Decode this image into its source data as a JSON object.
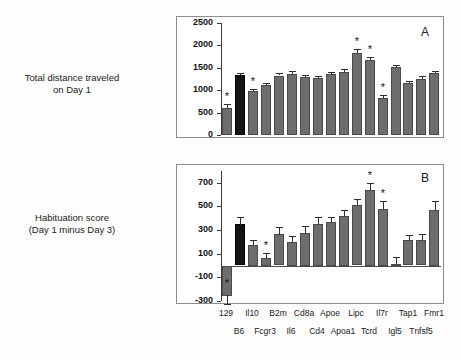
{
  "figure": {
    "background_color": "#ffffff",
    "bar_color": "#6d6d6d",
    "control_bar_color": "#141414",
    "axis_color": "#3b3b3b"
  },
  "panel_a": {
    "letter": "A",
    "axis_title_line1": "Total distance traveled",
    "axis_title_line2": "on Day 1"
  },
  "panel_b": {
    "letter": "B",
    "axis_title_line1": "Habituation score",
    "axis_title_line2": "(Day 1 minus Day 3)"
  },
  "chart_data": [
    {
      "type": "bar",
      "title": "Total distance traveled on Day 1",
      "panel": "A",
      "xlabel": "",
      "ylabel": "Total distance traveled on Day 1",
      "ylim": [
        0,
        2500
      ],
      "yticks": [
        0,
        500,
        1000,
        1500,
        2000,
        2500
      ],
      "grid": false,
      "legend": "none",
      "categories": [
        "129",
        "B6",
        "Il10",
        "Fcgr3",
        "B2m",
        "Il6",
        "Cd8a",
        "Cd4",
        "Apoe",
        "Apoa1",
        "Lipc",
        "Tcrd",
        "Il7r",
        "Igl5",
        "Tap1",
        "Tnfsf5",
        "Fmr1"
      ],
      "values": [
        610,
        1350,
        990,
        1115,
        1320,
        1360,
        1295,
        1275,
        1360,
        1410,
        1820,
        1680,
        835,
        1515,
        1150,
        1250,
        1380
      ],
      "errors": [
        85,
        45,
        40,
        45,
        55,
        60,
        55,
        45,
        55,
        60,
        95,
        70,
        60,
        55,
        45,
        65,
        55
      ],
      "significant": [
        "129",
        "Il10",
        "Lipc",
        "Tcrd",
        "Il7r"
      ],
      "control_category": "B6"
    },
    {
      "type": "bar",
      "title": "Habituation score (Day 1 minus Day 3)",
      "panel": "B",
      "xlabel": "",
      "ylabel": "Habituation score (Day 1 minus Day 3)",
      "ylim": [
        -300,
        800
      ],
      "yticks": [
        -300,
        -100,
        100,
        300,
        500,
        700
      ],
      "grid": false,
      "legend": "none",
      "categories": [
        "129",
        "B6",
        "Il10",
        "Fcgr3",
        "B2m",
        "Il6",
        "Cd8a",
        "Cd4",
        "Apoe",
        "Apoa1",
        "Lipc",
        "Tcrd",
        "Il7r",
        "Igl5",
        "Tap1",
        "Tnfsf5",
        "Fmr1"
      ],
      "values": [
        -250,
        350,
        175,
        65,
        265,
        200,
        275,
        355,
        370,
        420,
        510,
        640,
        480,
        10,
        215,
        215,
        470
      ],
      "errors": [
        75,
        65,
        45,
        45,
        65,
        50,
        60,
        55,
        45,
        50,
        55,
        60,
        70,
        60,
        45,
        50,
        75
      ],
      "significant": [
        "129",
        "Fcgr3",
        "Tcrd",
        "Il7r"
      ],
      "control_category": "B6"
    }
  ],
  "x_axis": {
    "row1": [
      "129",
      "Il10",
      "B2m",
      "Cd8a",
      "Apoe",
      "Lipc",
      "Il7r",
      "Tap1",
      "Fmr1"
    ],
    "row2": [
      "B6",
      "Fcgr3",
      "Il6",
      "Cd4",
      "Apoa1",
      "Tcrd",
      "Igl5",
      "Tnfsf5"
    ]
  },
  "significance_marker": "*"
}
